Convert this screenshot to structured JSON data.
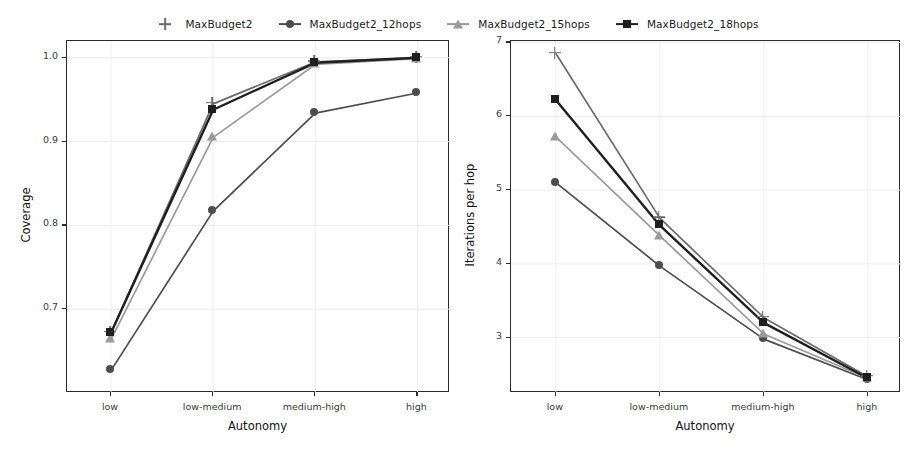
{
  "figure": {
    "width": 913,
    "height": 463,
    "background": "#ffffff"
  },
  "legend": {
    "position": "top-center",
    "entries": [
      {
        "label": "MaxBudget2",
        "marker": "plus-icon",
        "color": "#6b6b6b"
      },
      {
        "label": "MaxBudget2_12hops",
        "marker": "circle-icon",
        "color": "#4d4d4d"
      },
      {
        "label": "MaxBudget2_15hops",
        "marker": "triangle-icon",
        "color": "#9a9a9a"
      },
      {
        "label": "MaxBudget2_18hops",
        "marker": "square-icon",
        "color": "#1f1f1f"
      }
    ]
  },
  "chart_data": [
    {
      "id": "coverage",
      "type": "line",
      "title": "",
      "xlabel": "Autonomy",
      "ylabel": "Coverage",
      "categories": [
        "low",
        "low-medium",
        "medium-high",
        "high"
      ],
      "yticks": [
        0.7,
        0.8,
        0.9,
        1.0
      ],
      "ytick_labels": [
        "0.7",
        "0.8",
        "0.9",
        "1.0"
      ],
      "ylim": [
        0.6,
        1.02
      ],
      "grid": true,
      "legend_position": "top",
      "series": [
        {
          "name": "MaxBudget2",
          "marker": "plus-icon",
          "color": "#6b6b6b",
          "values": [
            0.672,
            0.945,
            0.995,
            1.0
          ]
        },
        {
          "name": "MaxBudget2_12hops",
          "marker": "circle-icon",
          "color": "#4d4d4d",
          "values": [
            0.627,
            0.817,
            0.934,
            0.958
          ]
        },
        {
          "name": "MaxBudget2_15hops",
          "marker": "triangle-icon",
          "color": "#9a9a9a",
          "values": [
            0.664,
            0.905,
            0.992,
            0.999
          ]
        },
        {
          "name": "MaxBudget2_18hops",
          "marker": "square-icon",
          "color": "#1f1f1f",
          "values": [
            0.672,
            0.938,
            0.994,
            1.0
          ]
        }
      ]
    },
    {
      "id": "iterations-per-hop",
      "type": "line",
      "title": "",
      "xlabel": "Autonomy",
      "ylabel": "Iterations per hop",
      "categories": [
        "low",
        "low-medium",
        "medium-high",
        "high"
      ],
      "yticks": [
        3,
        4,
        5,
        6,
        7
      ],
      "ytick_labels": [
        "3",
        "4",
        "5",
        "6",
        "7"
      ],
      "ylim": [
        2.25,
        7.02
      ],
      "grid": true,
      "legend_position": "top",
      "series": [
        {
          "name": "MaxBudget2",
          "marker": "plus-icon",
          "color": "#6b6b6b",
          "values": [
            6.85,
            4.62,
            3.27,
            2.47
          ]
        },
        {
          "name": "MaxBudget2_12hops",
          "marker": "circle-icon",
          "color": "#4d4d4d",
          "values": [
            5.1,
            3.97,
            2.98,
            2.43
          ]
        },
        {
          "name": "MaxBudget2_15hops",
          "marker": "triangle-icon",
          "color": "#9a9a9a",
          "values": [
            5.72,
            4.38,
            3.05,
            2.45
          ]
        },
        {
          "name": "MaxBudget2_18hops",
          "marker": "square-icon",
          "color": "#1f1f1f",
          "values": [
            6.22,
            4.52,
            3.2,
            2.45
          ]
        }
      ]
    }
  ]
}
